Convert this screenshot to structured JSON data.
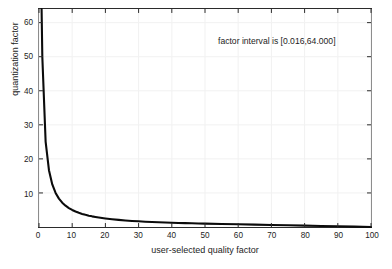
{
  "chart_data": {
    "type": "line",
    "title": "",
    "xlabel": "user-selected quality factor",
    "ylabel": "quantization factor",
    "xlim": [
      0,
      100
    ],
    "ylim": [
      0,
      64
    ],
    "xticks": [
      0,
      10,
      20,
      30,
      40,
      50,
      60,
      70,
      80,
      90,
      100
    ],
    "yticks": [
      10,
      20,
      30,
      40,
      50,
      60
    ],
    "xtick_labels": [
      "0",
      "10",
      "20",
      "30",
      "40",
      "50",
      "60",
      "70",
      "80",
      "90",
      "100"
    ],
    "ytick_labels": [
      "10",
      "20",
      "30",
      "40",
      "50",
      "60"
    ],
    "grid": true,
    "legend": null,
    "annotations": [
      {
        "text": "factor interval is [0.016,64.000]",
        "x": 60,
        "y": 57
      }
    ],
    "series": [
      {
        "name": "quantization factor",
        "color": "#0b0b0b",
        "x": [
          0.78,
          1,
          2,
          3,
          4,
          5,
          6,
          7,
          8,
          9,
          10,
          11,
          12,
          13,
          14,
          15,
          16,
          17,
          18,
          19,
          20,
          22,
          24,
          26,
          28,
          30,
          32,
          34,
          36,
          38,
          40,
          42,
          44,
          46,
          48,
          50,
          55,
          60,
          65,
          70,
          75,
          80,
          85,
          90,
          95,
          100
        ],
        "y": [
          64.0,
          50.0,
          25.0,
          16.667,
          12.5,
          10.0,
          8.333,
          7.143,
          6.25,
          5.556,
          5.0,
          4.545,
          4.167,
          3.846,
          3.571,
          3.333,
          3.125,
          2.941,
          2.778,
          2.632,
          2.5,
          2.273,
          2.083,
          1.923,
          1.786,
          1.667,
          1.563,
          1.471,
          1.389,
          1.316,
          1.25,
          1.19,
          1.136,
          1.087,
          1.042,
          1.0,
          0.9,
          0.8,
          0.7,
          0.6,
          0.5,
          0.4,
          0.3,
          0.2,
          0.1,
          0.016
        ]
      }
    ],
    "interval_min": 0.016,
    "interval_max": 64.0
  },
  "figure": {
    "background_color": "#ffffff",
    "axis_color": "#2b2b2b",
    "grid_color": "#f1f1f1",
    "curve_color": "#0b0b0b"
  }
}
